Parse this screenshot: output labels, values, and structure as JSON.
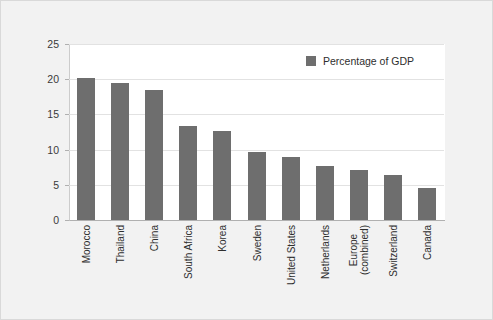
{
  "chart_data": {
    "type": "bar",
    "title": "",
    "subtitle": "",
    "xlabel": "",
    "ylabel": "",
    "ylim": [
      0,
      25
    ],
    "yticks": [
      0,
      5,
      10,
      15,
      20,
      25
    ],
    "grid": true,
    "legend_position": "top-right",
    "legend": [
      "Percentage of GDP"
    ],
    "series_color": "#6e6e6e",
    "categories": [
      "Morocco",
      "Thailand",
      "China",
      "South Africa",
      "Korea",
      "Sweden",
      "United States",
      "Netherlands",
      "Europe (combined)",
      "Switzerland",
      "Canada"
    ],
    "category_lines": [
      [
        "Morocco"
      ],
      [
        "Thailand"
      ],
      [
        "China"
      ],
      [
        "South Africa"
      ],
      [
        "Korea"
      ],
      [
        "Sweden"
      ],
      [
        "United States"
      ],
      [
        "Netherlands"
      ],
      [
        "Europe",
        "(combined)"
      ],
      [
        "Switzerland"
      ],
      [
        "Canada"
      ]
    ],
    "series": [
      {
        "name": "Percentage of GDP",
        "values": [
          20.2,
          19.5,
          18.4,
          13.3,
          12.7,
          9.6,
          8.9,
          7.7,
          7.1,
          6.4,
          4.6
        ]
      }
    ]
  },
  "legend": {
    "label": "Percentage of GDP"
  },
  "axis": {
    "y_ticks": [
      "0",
      "5",
      "10",
      "15",
      "20",
      "25"
    ]
  },
  "colors": {
    "bar": "#6e6e6e",
    "plot_background": "#ffffff",
    "figure_background": "#f2f2f2",
    "gridline": "#e2e2e2"
  }
}
